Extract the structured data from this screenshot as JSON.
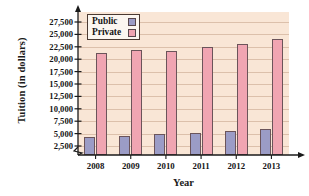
{
  "chart_data": {
    "type": "bar",
    "title": "",
    "xlabel": "Year",
    "ylabel": "Tuition (in dollars)",
    "categories": [
      "2008",
      "2009",
      "2010",
      "2011",
      "2012",
      "2013"
    ],
    "series": [
      {
        "name": "Public",
        "color": "#9b9cc6",
        "values": [
          4300,
          4600,
          4900,
          5100,
          5600,
          5900
        ]
      },
      {
        "name": "Private",
        "color": "#f0a5b2",
        "values": [
          21200,
          21800,
          21700,
          22400,
          23000,
          24100
        ]
      }
    ],
    "ytick_labels": [
      "27,500",
      "25,000",
      "22,500",
      "20,000",
      "17,500",
      "15,000",
      "12,500",
      "10,000",
      "7,500",
      "5,000",
      "2,500"
    ],
    "ytick_values": [
      27500,
      25000,
      22500,
      20000,
      17500,
      15000,
      12500,
      10000,
      7500,
      5000,
      2500
    ],
    "ylim": [
      2500,
      27500
    ],
    "axis_break": true,
    "grid": true,
    "legend_position": "top-left",
    "plot_background": "#f9e6d6",
    "gridline_color": "#dcc0ab",
    "axis_color": "#1a1a1a"
  },
  "legend": {
    "entries": [
      {
        "label": "Public"
      },
      {
        "label": "Private"
      }
    ]
  }
}
